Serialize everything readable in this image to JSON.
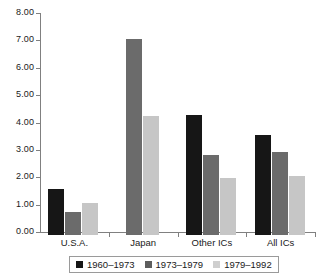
{
  "chart_data": {
    "type": "bar",
    "title": "",
    "subtitle": "",
    "xlabel": "",
    "ylabel": "",
    "categories": [
      "U.S.A.",
      "Japan",
      "Other ICs",
      "All ICs"
    ],
    "series": [
      {
        "name": "1960–1973",
        "color": "#161616",
        "values": [
          1.68,
          null,
          4.38,
          3.65
        ]
      },
      {
        "name": "1973–1979",
        "color": "#6b6b6b",
        "values": [
          0.84,
          7.15,
          2.92,
          3.03
        ]
      },
      {
        "name": "1979–1992",
        "color": "#c6c6c6",
        "values": [
          1.17,
          4.34,
          2.08,
          2.15
        ]
      }
    ],
    "ylim": [
      0,
      8
    ],
    "ytick_step": 1,
    "ytick_labels": [
      "0.00",
      "1.00",
      "2.00",
      "3.00",
      "4.00",
      "5.00",
      "6.00",
      "7.00",
      "8.00"
    ],
    "ytick_values": [
      0,
      1,
      2,
      3,
      4,
      5,
      6,
      7,
      8
    ],
    "grid": false,
    "legend_position": "bottom",
    "axis_color": "#808080"
  }
}
